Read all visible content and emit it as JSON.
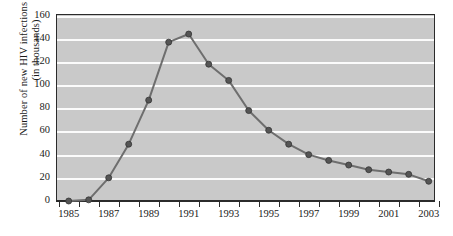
{
  "chart_data": {
    "type": "line",
    "title": "",
    "xlabel": "",
    "ylabel": "Number of new HIV infections per year (in thousands)",
    "ylabel_line1": "Number of new HIV infections per year",
    "ylabel_line2": "(in thousands)",
    "ylim": [
      0,
      160
    ],
    "ytick_step": 20,
    "yticks": [
      0,
      20,
      40,
      60,
      80,
      100,
      120,
      140,
      160
    ],
    "ytick_labels": [
      "0",
      "20",
      "40",
      "60",
      "80",
      "100",
      "120",
      "140",
      "160"
    ],
    "xlim": [
      1985,
      2003
    ],
    "xticks": [
      1985,
      1986,
      1987,
      1988,
      1989,
      1990,
      1991,
      1992,
      1993,
      1994,
      1995,
      1996,
      1997,
      1998,
      1999,
      2000,
      2001,
      2002,
      2003
    ],
    "xtick_labels": [
      "1985",
      "",
      "1987",
      "",
      "1989",
      "",
      "1991",
      "",
      "1993",
      "",
      "1995",
      "",
      "1997",
      "",
      "1999",
      "",
      "2001",
      "",
      "2003"
    ],
    "xtick_labels_shown": [
      "1985",
      "1987",
      "1989",
      "1991",
      "1993",
      "1995",
      "1997",
      "1999",
      "2001",
      "2003"
    ],
    "grid": true,
    "grid_color": "#fbfbfb",
    "plot_bg": "#c9c9c9",
    "line_color": "#6e6e6e",
    "marker_color": "#555555",
    "legend": [],
    "x": [
      1985,
      1986,
      1987,
      1988,
      1989,
      1990,
      1991,
      1992,
      1993,
      1994,
      1995,
      1996,
      1997,
      1998,
      1999,
      2000,
      2001,
      2002,
      2003
    ],
    "values": [
      0,
      1,
      20,
      49,
      87,
      137,
      144,
      118,
      104,
      78,
      61,
      49,
      40,
      35,
      31,
      27,
      25,
      23,
      17
    ]
  }
}
